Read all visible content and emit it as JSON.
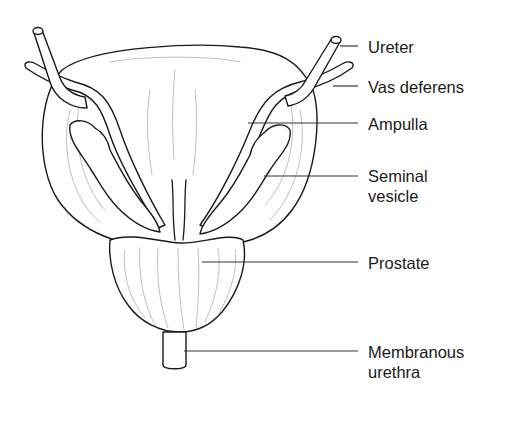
{
  "diagram": {
    "labels": [
      {
        "id": "ureter",
        "text": "Ureter",
        "x": 368,
        "y": 37
      },
      {
        "id": "vas-deferens",
        "text": "Vas deferens",
        "x": 368,
        "y": 77
      },
      {
        "id": "ampulla",
        "text": "Ampulla",
        "x": 368,
        "y": 115
      },
      {
        "id": "seminal-vesicle",
        "lines": [
          "Seminal",
          "vesicle"
        ],
        "x": 368,
        "y": 167
      },
      {
        "id": "prostate",
        "text": "Prostate",
        "x": 368,
        "y": 254
      },
      {
        "id": "membranous-urethra",
        "lines": [
          "Membranous",
          "urethra"
        ],
        "x": 368,
        "y": 343
      }
    ],
    "colors": {
      "line": "#1a1a1a",
      "shading": "#b8b8b8",
      "background": "#ffffff"
    }
  }
}
